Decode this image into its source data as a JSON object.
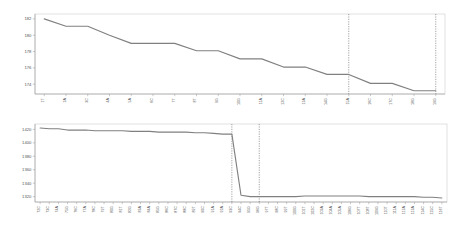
{
  "figure": {
    "background": "#ffffff",
    "series_color": "#808080",
    "frame_color": "#cccccc",
    "axis_color": "#999999",
    "marker_line_color": "#666666"
  },
  "chart_data": [
    {
      "id": "top",
      "type": "line",
      "title": "",
      "xlabel": "",
      "ylabel": "",
      "grid": false,
      "legend": "none",
      "ylim": [
        172.8,
        182.6
      ],
      "yticks": [
        174,
        176,
        178,
        180,
        182
      ],
      "ytick_labels": [
        "174",
        "176",
        "178",
        "180",
        "182"
      ],
      "categories": [
        "1T",
        "2A",
        "3C",
        "4A",
        "5A",
        "6C",
        "7T",
        "8T",
        "9G",
        "10G",
        "11A",
        "12C",
        "13A",
        "14G",
        "15A",
        "16C",
        "17C",
        "18G",
        "19G"
      ],
      "values": [
        182.0,
        181.1,
        181.1,
        180.0,
        179.0,
        179.0,
        179.0,
        178.1,
        178.1,
        177.1,
        177.1,
        176.1,
        176.1,
        175.2,
        175.2,
        174.1,
        174.1,
        173.2,
        173.2
      ],
      "vertical_markers": [
        {
          "category": "15A",
          "x_index": 14
        },
        {
          "category": "19G",
          "x_index": 18
        }
      ]
    },
    {
      "id": "bottom",
      "type": "line",
      "title": "",
      "xlabel": "",
      "ylabel": "",
      "grid": false,
      "legend": "none",
      "ylim": [
        1312,
        1428
      ],
      "yticks": [
        1320,
        1340,
        1360,
        1380,
        1400,
        1420
      ],
      "ytick_labels": [
        "1320",
        "1340",
        "1360",
        "1380",
        "1400",
        "1420"
      ],
      "categories": [
        "72C",
        "73C",
        "74A",
        "75G",
        "76C",
        "77A",
        "78C",
        "79T",
        "80G",
        "81T",
        "82G",
        "83A",
        "84A",
        "85G",
        "86C",
        "87C",
        "88C",
        "89T",
        "90C",
        "91A",
        "92A",
        "93C",
        "94C",
        "95G",
        "96G",
        "97T",
        "98C",
        "99T",
        "100G",
        "101T",
        "102C",
        "103A",
        "104A",
        "105A",
        "106G",
        "107T",
        "108T",
        "109G",
        "110T",
        "111A",
        "112A",
        "113A",
        "114C",
        "115C",
        "116T"
      ],
      "values": [
        1422,
        1421,
        1421,
        1419,
        1419,
        1419,
        1418,
        1418,
        1418,
        1418,
        1417,
        1417,
        1417,
        1416,
        1416,
        1416,
        1416,
        1415,
        1415,
        1414,
        1413,
        1413,
        1322,
        1320,
        1320,
        1320,
        1320,
        1320,
        1320,
        1321,
        1321,
        1321,
        1321,
        1321,
        1321,
        1321,
        1320,
        1320,
        1320,
        1320,
        1320,
        1320,
        1319,
        1319,
        1318
      ],
      "vertical_markers": [
        {
          "category": "93C",
          "x_index": 21
        },
        {
          "category": "96G",
          "x_index": 24
        }
      ]
    }
  ]
}
